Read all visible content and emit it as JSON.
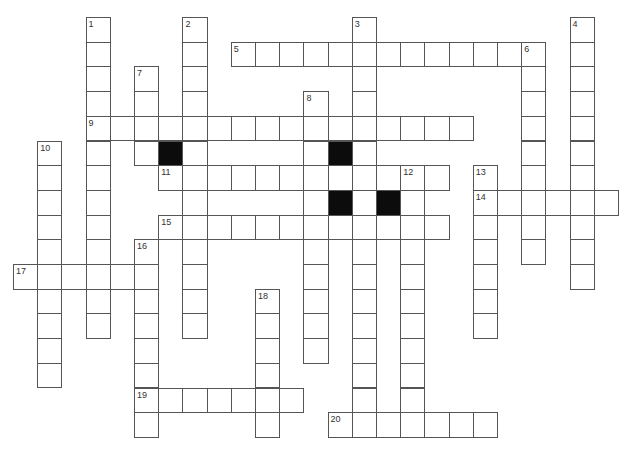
{
  "puzzle": {
    "type": "crossword",
    "grid_rows": 17,
    "grid_cols": 25,
    "colors": {
      "cell_border": "#555555",
      "cell_fill": "#ffffff",
      "block_fill": "#0c0c0c",
      "number_text": "#333333"
    },
    "entries": [
      {
        "number": "1",
        "direction": "down",
        "row": 0,
        "col": 3,
        "length": 13
      },
      {
        "number": "2",
        "direction": "down",
        "row": 0,
        "col": 7,
        "length": 13
      },
      {
        "number": "3",
        "direction": "down",
        "row": 0,
        "col": 14,
        "length": 17
      },
      {
        "number": "4",
        "direction": "down",
        "row": 0,
        "col": 23,
        "length": 11
      },
      {
        "number": "5",
        "direction": "across",
        "row": 1,
        "col": 9,
        "length": 13
      },
      {
        "number": "6",
        "direction": "down",
        "row": 1,
        "col": 21,
        "length": 9
      },
      {
        "number": "7",
        "direction": "down",
        "row": 2,
        "col": 5,
        "length": 4
      },
      {
        "number": "8",
        "direction": "down",
        "row": 3,
        "col": 12,
        "length": 11
      },
      {
        "number": "9",
        "direction": "across",
        "row": 4,
        "col": 3,
        "length": 16
      },
      {
        "number": "10",
        "direction": "down",
        "row": 5,
        "col": 1,
        "length": 10
      },
      {
        "number": "11",
        "direction": "across",
        "row": 6,
        "col": 6,
        "length": 12
      },
      {
        "number": "12",
        "direction": "down",
        "row": 6,
        "col": 16,
        "length": 11
      },
      {
        "number": "13",
        "direction": "down",
        "row": 6,
        "col": 19,
        "length": 7
      },
      {
        "number": "14",
        "direction": "across",
        "row": 7,
        "col": 19,
        "length": 6
      },
      {
        "number": "15",
        "direction": "across",
        "row": 8,
        "col": 6,
        "length": 12
      },
      {
        "number": "16",
        "direction": "down",
        "row": 9,
        "col": 5,
        "length": 8
      },
      {
        "number": "17",
        "direction": "across",
        "row": 10,
        "col": 0,
        "length": 6
      },
      {
        "number": "18",
        "direction": "down",
        "row": 11,
        "col": 10,
        "length": 6
      },
      {
        "number": "19",
        "direction": "across",
        "row": 15,
        "col": 5,
        "length": 7
      },
      {
        "number": "20",
        "direction": "across",
        "row": 16,
        "col": 13,
        "length": 7
      }
    ],
    "blocks": [
      {
        "row": 5,
        "col": 6
      },
      {
        "row": 5,
        "col": 13
      },
      {
        "row": 7,
        "col": 13
      },
      {
        "row": 7,
        "col": 15
      }
    ],
    "letters": {}
  }
}
